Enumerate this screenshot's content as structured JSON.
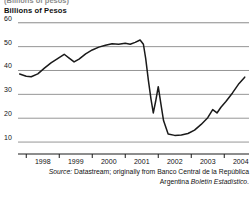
{
  "figure": {
    "clipped_title": "(Billions of pesos)",
    "subtitle": "Billions of Pesos",
    "source_line1_label": "Source:",
    "source_line1_text": " Datastream; originally from Banco Central de la República",
    "source_line2_text": "Argentina ",
    "source_line2_italic": "Boletín Estadístico",
    "source_line2_end": "."
  },
  "chart_data": {
    "type": "line",
    "title": "(Billions of pesos)",
    "subtitle": "Billions of Pesos",
    "xlabel": "",
    "ylabel": "Billions of Pesos",
    "xlim": [
      1997.75,
      2004.75
    ],
    "ylim": [
      5,
      62
    ],
    "yticks": [
      60,
      50,
      40,
      30,
      20,
      10
    ],
    "ytick_labels": [
      "60",
      "50",
      "40",
      "30",
      "20",
      "10"
    ],
    "xticks": [
      1998,
      1999,
      2000,
      2001,
      2002,
      2003,
      2004
    ],
    "xtick_labels": [
      "1998",
      "1999",
      "2000",
      "2001",
      "2002",
      "2003",
      "2004"
    ],
    "grid": "horizontal",
    "legend": "none",
    "line_color": "#1a1a1a",
    "series": [
      {
        "name": "Deposits",
        "x": [
          1997.8,
          1998.0,
          1998.15,
          1998.35,
          1998.55,
          1998.75,
          1998.95,
          1999.15,
          1999.3,
          1999.45,
          1999.6,
          1999.8,
          2000.0,
          2000.2,
          2000.4,
          2000.6,
          2000.8,
          2001.0,
          2001.15,
          2001.3,
          2001.45,
          2001.55,
          2001.62,
          2001.7,
          2001.78,
          2001.85,
          2001.92,
          2002.0,
          2002.08,
          2002.16,
          2002.3,
          2002.5,
          2002.7,
          2002.9,
          2003.1,
          2003.3,
          2003.5,
          2003.65,
          2003.78,
          2003.9,
          2004.05,
          2004.25,
          2004.45,
          2004.62
        ],
        "y": [
          38.5,
          37.6,
          37.4,
          38.6,
          41.0,
          43.2,
          45.0,
          46.8,
          45.2,
          43.6,
          44.8,
          47.0,
          48.6,
          49.8,
          50.6,
          51.2,
          51.0,
          51.4,
          51.0,
          51.8,
          52.8,
          51.0,
          45.0,
          36.0,
          28.0,
          22.2,
          27.0,
          33.2,
          26.0,
          19.0,
          13.4,
          12.8,
          13.0,
          13.6,
          15.0,
          17.4,
          20.2,
          23.6,
          22.2,
          24.6,
          27.0,
          30.6,
          34.6,
          37.2
        ]
      }
    ]
  }
}
